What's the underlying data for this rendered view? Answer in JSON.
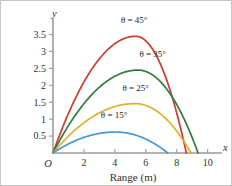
{
  "chart_data": {
    "type": "line",
    "title": "",
    "xlabel": "Range (m)",
    "ylabel": "y",
    "x_axis_symbol": "x",
    "y_axis_symbol": "y",
    "origin_label": "O",
    "xlim": [
      0,
      10.8
    ],
    "ylim": [
      0,
      3.9
    ],
    "xticks": [
      0,
      2,
      4,
      6,
      8,
      10
    ],
    "xticklabels": [
      "",
      "2",
      "4",
      "6",
      "8",
      "10"
    ],
    "yticks": [
      0.5,
      1,
      1.5,
      2,
      2.5,
      3,
      3.5
    ],
    "yticklabels": [
      "0.5",
      "1",
      "1.5",
      "2",
      "2.5",
      "3",
      "3.5"
    ],
    "grid": false,
    "legend": "inline-labels",
    "series": [
      {
        "name": "theta-45",
        "label": "θ = 45°",
        "color": "#cf3a31",
        "label_x": 5.25,
        "label_y": 3.83,
        "peak_x": 5.35,
        "peak_y": 3.45,
        "range": 8.62,
        "x": [
          0,
          0.43,
          0.86,
          1.29,
          1.73,
          2.16,
          2.59,
          3.02,
          3.45,
          3.88,
          4.31,
          4.74,
          5.17,
          5.6,
          6.03,
          6.47,
          6.9,
          7.33,
          7.76,
          8.19,
          8.62
        ],
        "y": [
          0,
          0.61,
          1.15,
          1.63,
          2.04,
          2.39,
          2.67,
          2.89,
          3.04,
          3.13,
          3.15,
          3.11,
          3.0,
          2.83,
          2.59,
          2.29,
          1.92,
          1.49,
          1.0,
          0.53,
          0
        ]
      },
      {
        "name": "theta-35",
        "label": "θ = 35°",
        "color": "#2f7c3c",
        "label_x": 6.45,
        "label_y": 2.83,
        "peak_x": 5.5,
        "peak_y": 2.45,
        "range": 9.38,
        "x": [
          0,
          0.47,
          0.94,
          1.41,
          1.88,
          2.34,
          2.81,
          3.28,
          3.75,
          4.22,
          4.69,
          5.16,
          5.63,
          6.1,
          6.57,
          7.04,
          7.5,
          7.97,
          8.44,
          8.91,
          9.38
        ],
        "y": [
          0,
          0.31,
          0.6,
          0.86,
          1.1,
          1.31,
          1.49,
          1.65,
          1.78,
          1.88,
          1.96,
          2.0,
          2.02,
          2.02,
          1.98,
          1.92,
          1.83,
          1.71,
          1.56,
          1.39,
          0
        ]
      },
      {
        "name": "theta-25",
        "label": "θ = 25°",
        "color": "#e3b02c",
        "label_x": 5.35,
        "label_y": 1.84,
        "peak_x": 5.3,
        "peak_y": 1.46,
        "range": 8.92,
        "x": [
          0,
          0.45,
          0.89,
          1.34,
          1.78,
          2.23,
          2.68,
          3.12,
          3.57,
          4.01,
          4.46,
          4.91,
          5.35,
          5.8,
          6.24,
          6.69,
          7.14,
          7.58,
          8.03,
          8.47,
          8.92
        ],
        "y": [
          0,
          0.2,
          0.38,
          0.55,
          0.7,
          0.83,
          0.95,
          1.05,
          1.13,
          1.2,
          1.25,
          1.28,
          1.29,
          1.29,
          1.26,
          1.22,
          1.17,
          1.09,
          1.0,
          0.89,
          0
        ]
      },
      {
        "name": "theta-15",
        "label": "θ = 15°",
        "color": "#3e9bd4",
        "label_x": 3.95,
        "label_y": 1.02,
        "peak_x": 4.05,
        "peak_y": 0.62,
        "range": 7.42,
        "x": [
          0,
          0.37,
          0.74,
          1.11,
          1.48,
          1.86,
          2.23,
          2.6,
          2.97,
          3.34,
          3.71,
          4.08,
          4.45,
          4.82,
          5.19,
          5.57,
          5.94,
          6.31,
          6.68,
          7.05,
          7.42
        ],
        "y": [
          0,
          0.1,
          0.19,
          0.27,
          0.34,
          0.41,
          0.46,
          0.51,
          0.55,
          0.58,
          0.61,
          0.62,
          0.63,
          0.62,
          0.61,
          0.59,
          0.56,
          0.52,
          0.47,
          0.41,
          0
        ]
      }
    ]
  },
  "colors": {
    "axis": "#9b9b9b",
    "text": "#332f2e",
    "background": "#ffffff",
    "border": "#c8c8c8"
  }
}
